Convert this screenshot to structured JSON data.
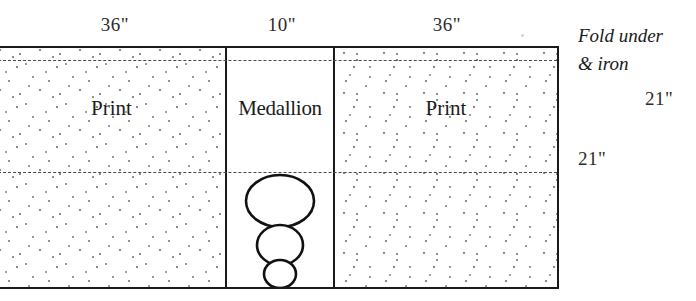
{
  "diagram": {
    "top_dimensions": [
      {
        "label": "36\"",
        "target": "left-print-panel"
      },
      {
        "label": "10\"",
        "target": "medallion-panel"
      },
      {
        "label": "36\"",
        "target": "right-print-panel"
      }
    ],
    "panels": [
      {
        "id": "left-print",
        "label": "Print",
        "fill": "dotted-fan-print",
        "width_in": 36
      },
      {
        "id": "medallion",
        "label": "Medallion",
        "fill": "plain-white",
        "width_in": 10
      },
      {
        "id": "right-print",
        "label": "Print",
        "fill": "dotted-fan-print",
        "width_in": 36
      }
    ],
    "fold_lines": [
      {
        "id": "top-fold",
        "style": "dashed"
      },
      {
        "id": "middle-fold",
        "style": "dashed"
      }
    ],
    "annotations": {
      "fold_note_line1": "Fold under",
      "fold_note_line2": "& iron",
      "top_height": "21\"",
      "bottom_height": "21\""
    },
    "motif": {
      "name": "medallion-motif",
      "shapes": [
        "large-ellipse",
        "medium-ellipse",
        "small-ellipse"
      ]
    },
    "colors": {
      "ink": "#1a1a1a",
      "dot": "#909090",
      "fold_dash": "#4a4a4a",
      "paper": "#ffffff"
    }
  }
}
